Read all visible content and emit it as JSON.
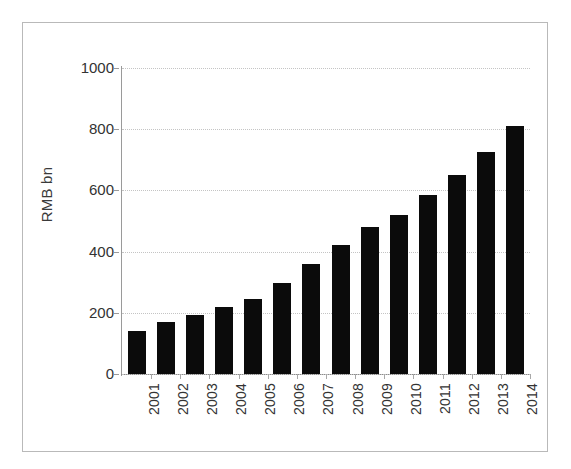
{
  "chart_data": {
    "type": "bar",
    "title": "",
    "subtitle": "",
    "xlabel": "",
    "ylabel": "RMB bn",
    "categories": [
      "2001",
      "2002",
      "2003",
      "2004",
      "2005",
      "2006",
      "2007",
      "2008",
      "2009",
      "2010",
      "2011",
      "2012",
      "2013",
      "2014"
    ],
    "values": [
      141,
      170,
      192,
      220,
      245,
      298,
      358,
      420,
      482,
      520,
      585,
      652,
      725,
      812
    ],
    "series": [
      {
        "name": "RMB bn",
        "values": [
          141,
          170,
          192,
          220,
          245,
          298,
          358,
          420,
          482,
          520,
          585,
          652,
          725,
          812
        ]
      }
    ],
    "ylim": [
      0,
      1000
    ],
    "yticks": [
      0,
      200,
      400,
      600,
      800,
      1000
    ],
    "ytick_labels": [
      "0",
      "200",
      "400",
      "600",
      "800",
      "1000"
    ],
    "grid": "horizontal-dotted",
    "legend": "none",
    "bar_color": "#0b0b0b",
    "gridline_color": "#c4c4c4",
    "axis_color": "#9a9a9a",
    "text_color": "#333333",
    "xtick_label_rotation": "90"
  }
}
